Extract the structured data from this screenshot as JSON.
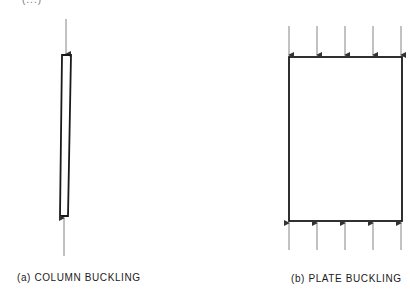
{
  "figure": {
    "top_fragment": "(...)",
    "panels": [
      {
        "id": "a",
        "caption": "(a) COLUMN BUCKLING",
        "element": "column",
        "load_arrows_top": 1,
        "load_arrows_bottom": 1
      },
      {
        "id": "b",
        "caption": "(b) PLATE BUCKLING",
        "element": "plate",
        "load_arrows_top": 5,
        "load_arrows_bottom": 5
      }
    ]
  },
  "colors": {
    "line": "#1a1a1a",
    "arrow": "#555555",
    "background": "#ffffff"
  }
}
